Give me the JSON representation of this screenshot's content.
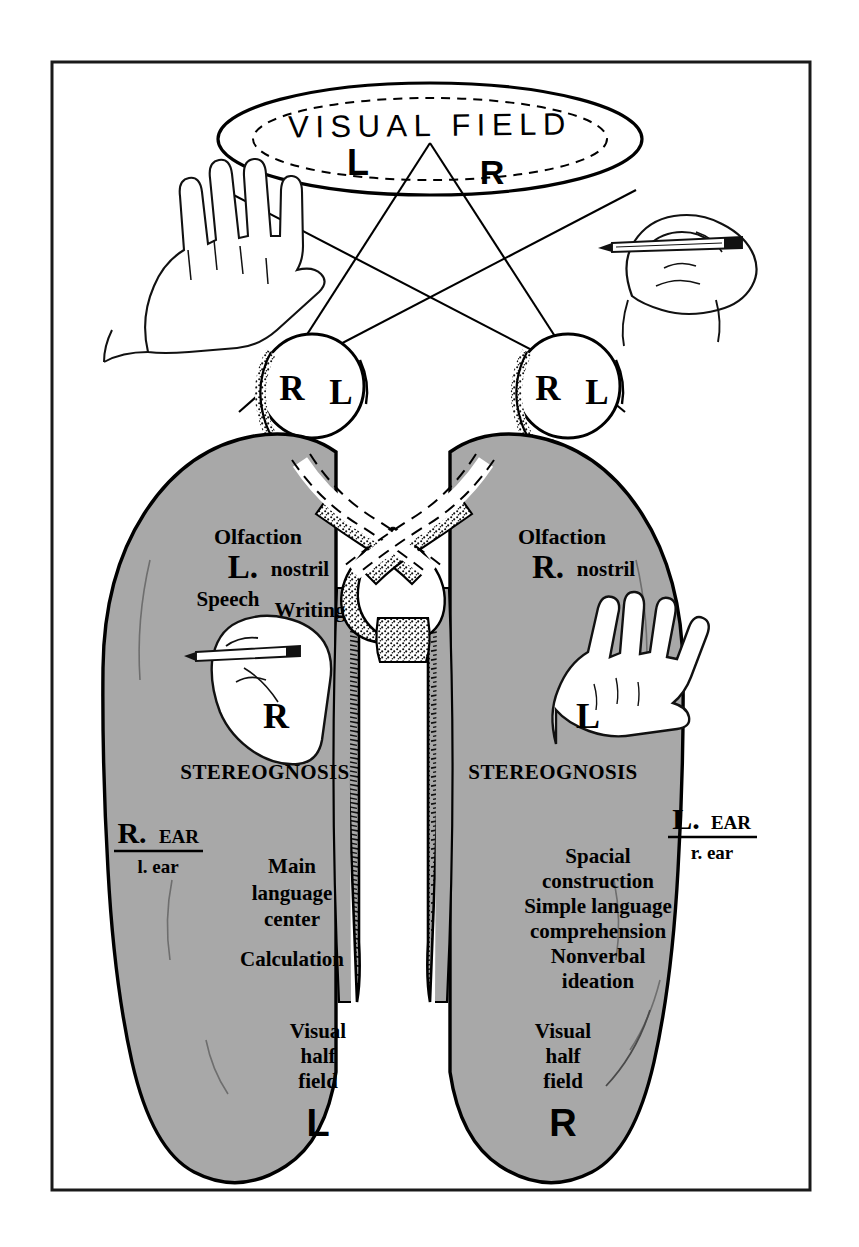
{
  "figure": {
    "domain_label": "neuroanatomy-diagram",
    "title": "VISUAL FIELD",
    "frame": {
      "present": true,
      "color": "#1a1a1a"
    },
    "colors": {
      "brain_gray": "#a8a8a8",
      "ink": "#000000",
      "paper": "#ffffff",
      "stipple": "#9a9a9a"
    }
  },
  "visual_field": {
    "title": "VISUAL FIELD",
    "left_half_label": "L",
    "right_half_label": "R"
  },
  "eyes": {
    "left_eye": {
      "nasal_label": "R",
      "temporal_label": "L"
    },
    "right_eye": {
      "nasal_label": "R",
      "temporal_label": "L"
    }
  },
  "external_hands": {
    "left_hand": {
      "name": "open-hand-left",
      "label": ""
    },
    "right_hand": {
      "name": "writing-hand-right",
      "label": ""
    }
  },
  "left_hemisphere": {
    "side": "left",
    "olfaction_title": "Olfaction",
    "olfaction_big": "L.",
    "olfaction_small": "nostril",
    "speech": "Speech",
    "writing": "Writing",
    "hand_label": "R",
    "stereognosis": "STEREOGNOSIS",
    "ear_big": "R.",
    "ear_caps": "EAR",
    "ear_small": "l. ear",
    "functions": [
      "Main",
      "language",
      "center"
    ],
    "calculation": "Calculation",
    "visual_field_lines": [
      "Visual",
      "half",
      "field"
    ],
    "visual_field_letter": "L"
  },
  "right_hemisphere": {
    "side": "right",
    "olfaction_title": "Olfaction",
    "olfaction_big": "R.",
    "olfaction_small": "nostril",
    "hand_label": "L",
    "stereognosis": "STEREOGNOSIS",
    "ear_big": "L.",
    "ear_caps": "EAR",
    "ear_small": "r. ear",
    "functions": [
      "Spacial",
      "construction",
      "Simple language",
      "comprehension",
      "Nonverbal",
      "ideation"
    ],
    "visual_field_lines": [
      "Visual",
      "half",
      "field"
    ],
    "visual_field_letter": "R"
  },
  "structures": {
    "optic_chiasm": "optic-chiasm",
    "corpus_callosum": "corpus-callosum-hatched-band",
    "optic_tract_crossed": "crossed-fibers-stippled",
    "optic_tract_uncrossed": "uncrossed-fibers-dashed"
  }
}
